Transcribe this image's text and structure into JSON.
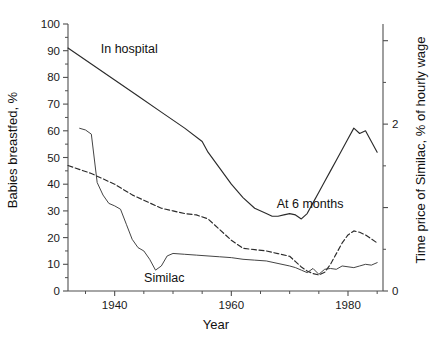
{
  "chart_data": {
    "type": "line",
    "title": "",
    "xlabel": "Year",
    "ylabel": "Babies breastfed, %",
    "y2label": "Time price of Similac, % of hourly wage",
    "xlim": [
      1932,
      1986
    ],
    "ylim": [
      0,
      100
    ],
    "y2lim": [
      0,
      3.2
    ],
    "grid": false,
    "legend_position": "inline-annotations",
    "x_ticks_major": [
      1940,
      1960,
      1980
    ],
    "x_tick_labels": [
      "1940",
      "1960",
      "1980"
    ],
    "x_ticks_minor": [
      1935,
      1945,
      1950,
      1955,
      1965,
      1970,
      1975,
      1985
    ],
    "y_ticks": [
      0,
      10,
      20,
      30,
      40,
      50,
      60,
      70,
      80,
      90,
      100
    ],
    "y_tick_labels": [
      "0",
      "10",
      "20",
      "30",
      "40",
      "50",
      "60",
      "70",
      "80",
      "90",
      "100"
    ],
    "y2_ticks_labeled": [
      0,
      2
    ],
    "y2_tick_labels": [
      "0",
      "2"
    ],
    "y2_ticks_minor": [
      1,
      3
    ],
    "annotations": [
      {
        "text": "In hospital",
        "x": 1942.5,
        "y": 89,
        "name": "in-hospital-label"
      },
      {
        "text": "At 6 months",
        "x": 1973.5,
        "y": 31,
        "name": "at-6-months-label"
      },
      {
        "text": "Similac",
        "x": 1948.5,
        "y": 3.5,
        "name": "similac-label"
      }
    ],
    "series": [
      {
        "name": "In hospital",
        "axis": "left",
        "style": "solid",
        "x": [
          1932,
          1936,
          1940,
          1944,
          1948,
          1952,
          1955,
          1956,
          1958,
          1960,
          1962,
          1964,
          1966,
          1967,
          1968,
          1969,
          1970,
          1971,
          1972,
          1973,
          1974,
          1975,
          1976,
          1977,
          1978,
          1979,
          1980,
          1981,
          1982,
          1983,
          1984,
          1985
        ],
        "values": [
          91,
          85,
          79,
          73,
          67,
          61,
          56,
          52,
          46,
          40,
          35,
          31,
          29,
          28,
          28,
          28.5,
          29,
          28.5,
          27,
          29,
          33,
          37,
          41,
          45,
          49,
          53,
          57,
          61,
          59,
          60,
          56,
          52
        ]
      },
      {
        "name": "At 6 months",
        "axis": "left",
        "style": "dashed",
        "x": [
          1932,
          1936,
          1940,
          1943,
          1946,
          1948,
          1950,
          1952,
          1954,
          1956,
          1958,
          1960,
          1962,
          1964,
          1966,
          1968,
          1970,
          1971,
          1972,
          1973,
          1974,
          1975,
          1976,
          1977,
          1978,
          1979,
          1980,
          1981,
          1982,
          1983,
          1984,
          1985
        ],
        "values": [
          47,
          44,
          40,
          36,
          33,
          31,
          30,
          29,
          28.5,
          27,
          23,
          19,
          16,
          15.5,
          15,
          14,
          13,
          11,
          9,
          7.5,
          6.5,
          6,
          7,
          10,
          14,
          18,
          21,
          22.5,
          22,
          21,
          19.5,
          18
        ]
      },
      {
        "name": "Similac",
        "axis": "right",
        "style": "thin",
        "x": [
          1934,
          1935,
          1936,
          1937,
          1938,
          1939,
          1940,
          1941,
          1942,
          1943,
          1944,
          1945,
          1946,
          1947,
          1948,
          1949,
          1950,
          1952,
          1954,
          1956,
          1958,
          1960,
          1962,
          1964,
          1966,
          1968,
          1970,
          1971,
          1972,
          1973,
          1974,
          1975,
          1976,
          1977,
          1978,
          1979,
          1980,
          1981,
          1982,
          1983,
          1984,
          1985
        ],
        "values": [
          1.95,
          1.93,
          1.88,
          1.3,
          1.15,
          1.05,
          1.02,
          0.98,
          0.8,
          0.62,
          0.52,
          0.48,
          0.38,
          0.25,
          0.3,
          0.42,
          0.45,
          0.44,
          0.43,
          0.42,
          0.41,
          0.4,
          0.38,
          0.37,
          0.36,
          0.33,
          0.3,
          0.28,
          0.25,
          0.22,
          0.27,
          0.2,
          0.26,
          0.27,
          0.26,
          0.3,
          0.29,
          0.28,
          0.3,
          0.32,
          0.31,
          0.34
        ]
      }
    ]
  },
  "caption": {
    "text": ""
  }
}
